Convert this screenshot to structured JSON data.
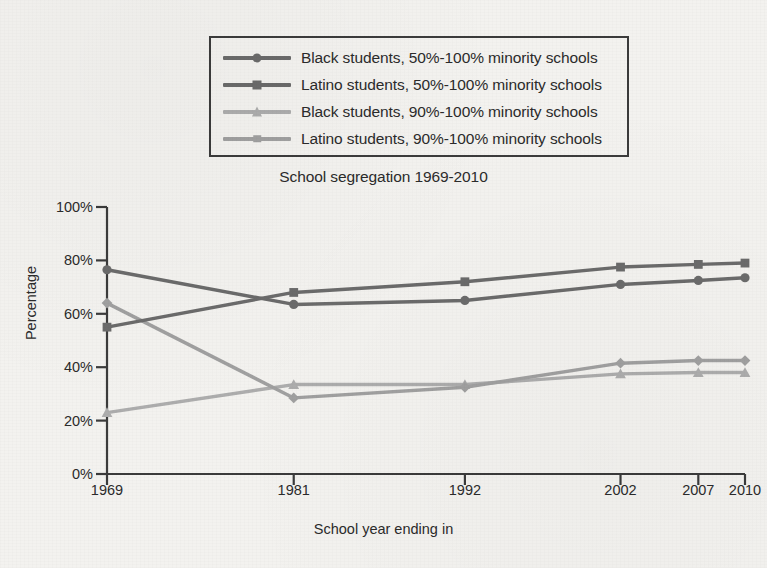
{
  "chart_data": {
    "type": "line",
    "title": "School segregation 1969-2010",
    "xlabel": "School year ending in",
    "ylabel": "Percentage",
    "grid": false,
    "legend_position": "top",
    "x": [
      1969,
      1981,
      1992,
      2002,
      2007,
      2010
    ],
    "xtick_labels": [
      "1969",
      "1981",
      "1992",
      "2002",
      "2007",
      "2010"
    ],
    "ytick_labels": [
      "0%",
      "20%",
      "40%",
      "60%",
      "80%",
      "100%"
    ],
    "ytick_values": [
      0,
      20,
      40,
      60,
      80,
      100
    ],
    "ylim": [
      0,
      100
    ],
    "xlim": [
      1969,
      2010
    ],
    "series": [
      {
        "name": "Black students, 50%-100% minority schools",
        "color": "#6b6b6b",
        "marker": "circle",
        "values": [
          76.5,
          63.5,
          65,
          71,
          72.5,
          73.5
        ]
      },
      {
        "name": "Latino students, 50%-100% minority schools",
        "color": "#6b6b6b",
        "marker": "square",
        "values": [
          55,
          68,
          72,
          77.5,
          78.5,
          79
        ]
      },
      {
        "name": "Black students, 90%-100% minority schools",
        "color": "#adadad",
        "marker": "triangle",
        "values": [
          23,
          33.5,
          33.5,
          37.5,
          38,
          38
        ]
      },
      {
        "name": "Latino students, 90%-100% minority schools",
        "color": "#a0a0a0",
        "marker": "diamond",
        "values": [
          64,
          28.5,
          32.5,
          41.5,
          42.5,
          42.5
        ]
      }
    ]
  },
  "legend": {
    "items": [
      {
        "label": "Black students, 50%-100% minority schools",
        "color": "#6b6b6b",
        "marker": "circle"
      },
      {
        "label": "Latino students, 50%-100% minority schools",
        "color": "#6b6b6b",
        "marker": "square"
      },
      {
        "label": "Black students, 90%-100% minority schools",
        "color": "#adadad",
        "marker": "triangle"
      },
      {
        "label": "Latino students, 90%-100% minority schools",
        "color": "#a0a0a0",
        "marker": "diamond"
      }
    ]
  },
  "colors": {
    "background": "#f3f2ef",
    "axis": "#3b3b3b",
    "text": "#2b2b2b",
    "dark_series": "#6b6b6b",
    "light_series": "#a8a8a8"
  }
}
